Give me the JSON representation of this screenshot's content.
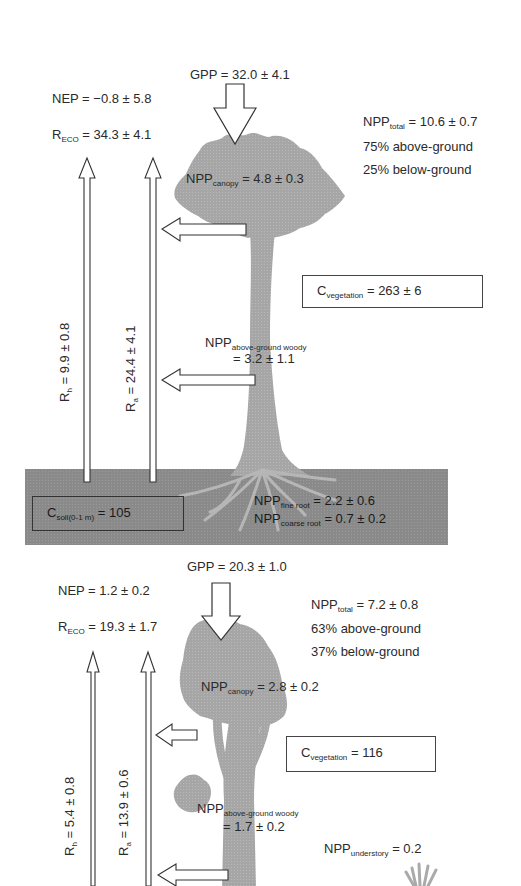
{
  "panels": [
    {
      "gpp": {
        "prefix": "GPP",
        "value": " = 32.0 ± 4.1"
      },
      "nep": {
        "prefix": "NEP",
        "value": " = −0.8 ± 5.8"
      },
      "reco": {
        "prefix": "R",
        "sub": "ECO",
        "value": " = 34.3 ± 4.1"
      },
      "npp_total": {
        "prefix": "NPP",
        "sub": "total",
        "value": " = 10.6 ± 0.7"
      },
      "above_pct": "75% above-ground",
      "below_pct": "25% below-ground",
      "npp_canopy": {
        "prefix": "NPP",
        "sub": "canopy",
        "value": " = 4.8 ± 0.3"
      },
      "c_vegetation": {
        "prefix": "C",
        "sub": "vegetation",
        "value": " = 263 ± 6"
      },
      "npp_woody": {
        "prefix": "NPP",
        "sub": "above-ground woody",
        "value": "= 3.2 ± 1.1"
      },
      "rh": {
        "prefix": "R",
        "sub": "h",
        "value": " = 9.9 ± 0.8"
      },
      "ra": {
        "prefix": "R",
        "sub": "a",
        "value": " = 24.4 ± 4.1"
      },
      "c_soil": {
        "prefix": "C",
        "sub": "soil(0-1 m)",
        "value": " = 105"
      },
      "npp_fine_root": {
        "prefix": "NPP",
        "sub": "fine root",
        "value": " = 2.2 ± 0.6"
      },
      "npp_coarse_root": {
        "prefix": "NPP",
        "sub": "coarse root",
        "value": " = 0.7 ± 0.2"
      }
    },
    {
      "gpp": {
        "prefix": "GPP",
        "value": " = 20.3 ± 1.0"
      },
      "nep": {
        "prefix": "NEP",
        "value": " = 1.2 ± 0.2"
      },
      "reco": {
        "prefix": "R",
        "sub": "ECO",
        "value": " = 19.3 ± 1.7"
      },
      "npp_total": {
        "prefix": "NPP",
        "sub": "total",
        "value": " = 7.2 ± 0.8"
      },
      "above_pct": "63% above-ground",
      "below_pct": "37% below-ground",
      "npp_canopy": {
        "prefix": "NPP",
        "sub": "canopy",
        "value": " = 2.8 ± 0.2"
      },
      "c_vegetation": {
        "prefix": "C",
        "sub": "vegetation",
        "value": " = 116"
      },
      "npp_woody": {
        "prefix": "NPP",
        "sub": "above-ground woody",
        "value": "= 1.7 ± 0.2"
      },
      "npp_understory": {
        "prefix": "NPP",
        "sub": "understory",
        "value": " = 0.2"
      },
      "rh": {
        "prefix": "R",
        "sub": "h",
        "value": " = 5.4 ± 0.8"
      },
      "ra": {
        "prefix": "R",
        "sub": "a",
        "value": " = 13.9 ± 0.6"
      }
    }
  ],
  "colors": {
    "tree": "#a8a8a8",
    "soil": "#8c8c8c",
    "roots": "#b4b4b4",
    "arrow_fill": "#ffffff",
    "arrow_stroke": "#333333",
    "text": "#2a2a2a"
  }
}
